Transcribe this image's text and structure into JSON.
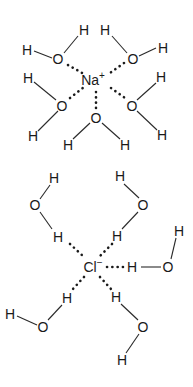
{
  "diagram": {
    "sodium": {
      "label": "Na",
      "charge": "+",
      "waters": [
        {
          "O": "O",
          "H1": "H",
          "H2": "H"
        },
        {
          "O": "O",
          "H1": "H",
          "H2": "H"
        },
        {
          "O": "O",
          "H1": "H",
          "H2": "H"
        },
        {
          "O": "O",
          "H1": "H",
          "H2": "H"
        },
        {
          "O": "O",
          "H1": "H",
          "H2": "H"
        }
      ]
    },
    "chloride": {
      "label": "Cl",
      "charge": "−",
      "waters": [
        {
          "O": "O",
          "H1": "H",
          "H2": "H"
        },
        {
          "O": "O",
          "H1": "H",
          "H2": "H"
        },
        {
          "O": "O",
          "H1": "H",
          "H2": "H"
        },
        {
          "O": "O",
          "H1": "H",
          "H2": "H"
        },
        {
          "O": "O",
          "H1": "H",
          "H2": "H"
        }
      ]
    }
  }
}
